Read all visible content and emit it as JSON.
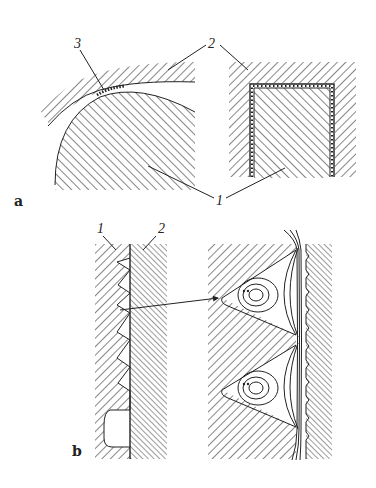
{
  "figure": {
    "panels": [
      {
        "id": "a",
        "label": "a",
        "parts": [
          {
            "number": "1",
            "description": "base body (hatched, convex curved surface and rectangular insert)"
          },
          {
            "number": "2",
            "description": "counter body (hatched, enveloping surface)"
          },
          {
            "number": "3",
            "description": "thin interface layer between bodies"
          }
        ],
        "callouts": {
          "part1": "1",
          "part2": "2",
          "part3": "3"
        }
      },
      {
        "id": "b",
        "label": "b",
        "parts": [
          {
            "number": "1",
            "description": "body with serrated/triangular cavities"
          },
          {
            "number": "2",
            "description": "adjacent flat body"
          }
        ],
        "callouts": {
          "part1": "1",
          "part2": "2"
        },
        "detail": "magnified view with circulating vortex streamlines inside triangular cavities"
      }
    ]
  }
}
